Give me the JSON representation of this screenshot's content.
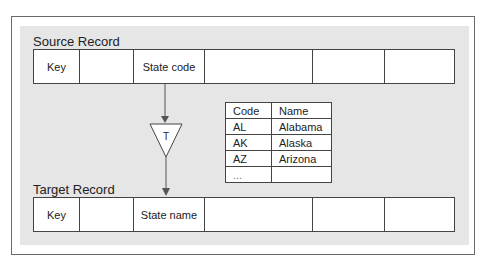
{
  "source": {
    "label": "Source Record",
    "fields": [
      "Key",
      "",
      "State code",
      "",
      "",
      ""
    ]
  },
  "target": {
    "label": "Target Record",
    "fields": [
      "Key",
      "",
      "State name",
      "",
      "",
      ""
    ]
  },
  "transform": {
    "label": "T"
  },
  "lookup_table": {
    "headers": [
      "Code",
      "Name"
    ],
    "rows": [
      [
        "AL",
        "Alabama"
      ],
      [
        "AK",
        "Alaska"
      ],
      [
        "AZ",
        "Arizona"
      ],
      [
        "...",
        ""
      ]
    ]
  }
}
